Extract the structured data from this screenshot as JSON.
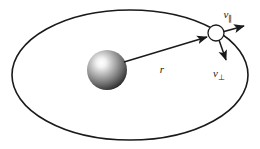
{
  "figure": {
    "background_color": "#ffffff",
    "stroke_color": "#1a1a1a",
    "width": 260,
    "height": 149
  },
  "orbit": {
    "name": "elliptical-orbit",
    "shape": "ellipse",
    "center_x": 130,
    "center_y": 75,
    "radius_x": 118,
    "radius_y": 65,
    "stroke_width": 1.6,
    "fill": "#ffffff"
  },
  "central_body": {
    "name": "central-sphere",
    "center_x": 107,
    "center_y": 70,
    "radius": 20,
    "highlight_color": "#ffffff",
    "mid_color": "#8a8a8a",
    "edge_color": "#2b2b2b",
    "highlight_offset_x": -6,
    "highlight_offset_y": -7
  },
  "orbiting_body": {
    "name": "orbiting-particle",
    "center_x": 216,
    "center_y": 33,
    "radius": 8,
    "fill": "#ffffff",
    "stroke_width": 1.3
  },
  "radius_vector": {
    "label": "r",
    "subscript": "",
    "x1": 124,
    "y1": 62,
    "x2": 208,
    "y2": 37,
    "label_x": 162,
    "label_y": 73,
    "font_size": 11
  },
  "velocity_parallel": {
    "label": "v",
    "subscript": "∥",
    "x1": 215,
    "y1": 34,
    "x2": 245,
    "y2": 26,
    "label_x": 228,
    "label_y": 18,
    "font_size": 11,
    "subscript_font_size": 8
  },
  "velocity_perpendicular": {
    "label": "v",
    "subscript": "⊥",
    "x1": 219,
    "y1": 40,
    "x2": 227,
    "y2": 62,
    "label_x": 219,
    "label_y": 77,
    "font_size": 11,
    "subscript_font_size": 8
  },
  "arrowhead": {
    "name": "solid-arrowhead",
    "length": 7,
    "width": 4.6
  }
}
